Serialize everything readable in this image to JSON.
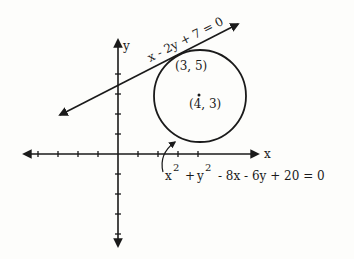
{
  "axes": {
    "x_label": "x",
    "y_label": "y",
    "origin_px": [
      118,
      154
    ],
    "unit_px": 20
  },
  "line": {
    "equation": "x - 2y + 7 = 0"
  },
  "circle": {
    "equation_parts": {
      "x": "x",
      "x_exp": "2",
      "plus1": "+",
      "y": "y",
      "y_exp": "2",
      "rest": "- 8x - 6y + 20 = 0"
    },
    "center_label": "(4, 3)",
    "center": [
      4,
      3
    ],
    "radius_squared": 5
  },
  "tangent_point": {
    "label": "(3, 5)",
    "coords": [
      3,
      5
    ]
  },
  "colors": {
    "ink": "#1a1a1a",
    "paper": "#fdfdfb"
  }
}
